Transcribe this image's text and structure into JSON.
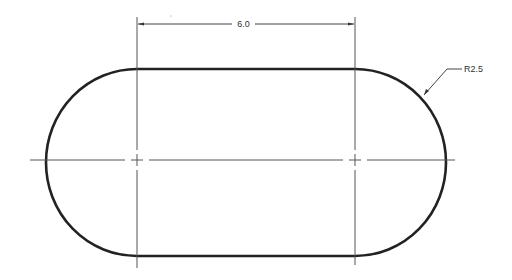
{
  "drawing": {
    "type": "slot / obround engineering drawing",
    "dimensions": {
      "linear": {
        "label": "6.0"
      },
      "radius": {
        "label": "R2.5"
      }
    },
    "colors": {
      "outline": "#222222",
      "thin_line": "#444444",
      "text": "#333333",
      "background": "#ffffff"
    }
  }
}
